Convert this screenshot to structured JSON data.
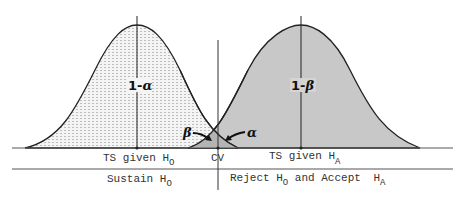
{
  "diagram": {
    "type": "hypothesis-test-distributions",
    "curves": [
      {
        "id": "null",
        "label": "TS given H",
        "label_sub": "O",
        "area_label_prefix": "1-",
        "area_label_greek": "α",
        "fill": "dotted-light-gray"
      },
      {
        "id": "alternative",
        "label": "TS given H",
        "label_sub": "A",
        "area_label_prefix": "1-",
        "area_label_greek": "β",
        "fill": "#c8c8c8"
      }
    ],
    "tails": {
      "beta": "β",
      "alpha": "α"
    },
    "critical_value": "CV",
    "regions": {
      "left": {
        "text": "Sustain H",
        "sub": "O"
      },
      "right": {
        "text": "Reject H",
        "sub": "O",
        "text2": " and Accept ",
        "text3": "H",
        "sub3": "A"
      }
    },
    "colors": {
      "line": "#222222",
      "alt_fill": "#c8c8c8",
      "null_fill": "#f2f2f2",
      "overlap_fill": "#b4b4b4"
    }
  }
}
